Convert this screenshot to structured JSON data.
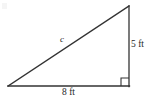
{
  "figure": {
    "kind": "right-triangle-diagram",
    "background_color": "#ffffff",
    "stroke_color": "#333333",
    "text_color": "#262626",
    "vertices": {
      "left": {
        "x": 8,
        "y": 86
      },
      "bottom_right": {
        "x": 129,
        "y": 86
      },
      "top_right": {
        "x": 129,
        "y": 6
      }
    },
    "right_angle_marker": {
      "name": "right-angle-square",
      "x": 121,
      "y": 78,
      "size": 8
    },
    "labels": {
      "hypotenuse": "c",
      "vertical_leg": "5 ft",
      "horizontal_leg": "8 ft"
    }
  }
}
